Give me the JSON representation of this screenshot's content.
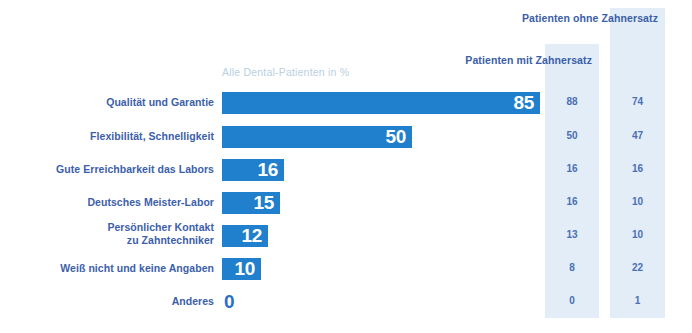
{
  "subtitle": "Alle Dental-Patienten in %",
  "columns": {
    "mit": "Patienten mit\nZahnersatz",
    "ohne": "Patienten ohne\nZahnersatz"
  },
  "colors": {
    "bar": "#2180cd",
    "label_text": "#3b60ab",
    "header_text": "#3a5ea8",
    "band": "#e2edf7",
    "subtitle_text": "#b9cfe2",
    "bar_value_text": "#ffffff",
    "outside_value_text": "#2a6fc4",
    "background": "#ffffff"
  },
  "chart_data": {
    "type": "bar",
    "orientation": "horizontal",
    "title": "",
    "subtitle": "Alle Dental-Patienten in %",
    "xlabel": "",
    "ylabel": "",
    "xlim": [
      0,
      100
    ],
    "grid": false,
    "legend": "none",
    "categories": [
      "Qualität und Garantie",
      "Flexibilität, Schnelligkeit",
      "Gute Erreichbarkeit das Labors",
      "Deutsches Meister-Labor",
      "Persönlicher Kontakt\nzu Zahntechniker",
      "Weiß nicht und keine Angaben",
      "Anderes"
    ],
    "values": [
      85,
      50,
      16,
      15,
      12,
      10,
      0
    ],
    "series": [
      {
        "name": "Alle Dental-Patienten in %",
        "values": [
          85,
          50,
          16,
          15,
          12,
          10,
          0
        ]
      },
      {
        "name": "Patienten mit Zahnersatz",
        "values": [
          88,
          50,
          16,
          16,
          13,
          8,
          0
        ]
      },
      {
        "name": "Patienten ohne Zahnersatz",
        "values": [
          74,
          47,
          16,
          10,
          10,
          22,
          1
        ]
      }
    ]
  },
  "rows": [
    {
      "label": "Qualität und Garantie",
      "value": "85",
      "width": 318,
      "mit": "88",
      "ohne": "74",
      "top": 92,
      "label_top": 4,
      "inside": true
    },
    {
      "label": "Flexibilität, Schnelligkeit",
      "value": "50",
      "width": 190,
      "mit": "50",
      "ohne": "47",
      "top": 126,
      "label_top": 4,
      "inside": true
    },
    {
      "label": "Gute Erreichbarkeit das Labors",
      "value": "16",
      "width": 62,
      "mit": "16",
      "ohne": "16",
      "top": 159,
      "label_top": 4,
      "inside": true
    },
    {
      "label": "Deutsches Meister-Labor",
      "value": "15",
      "width": 58,
      "mit": "16",
      "ohne": "10",
      "top": 192,
      "label_top": 4,
      "inside": true
    },
    {
      "label": "Persönlicher Kontakt\nzu Zahntechniker",
      "value": "12",
      "width": 46,
      "mit": "13",
      "ohne": "10",
      "top": 225,
      "label_top": -4,
      "inside": true
    },
    {
      "label": "Weiß nicht und keine Angaben",
      "value": "10",
      "width": 39,
      "mit": "8",
      "ohne": "22",
      "top": 258,
      "label_top": 4,
      "inside": true
    },
    {
      "label": "Anderes",
      "value": "0",
      "width": 0,
      "mit": "0",
      "ohne": "1",
      "top": 291,
      "label_top": 4,
      "inside": false
    }
  ]
}
